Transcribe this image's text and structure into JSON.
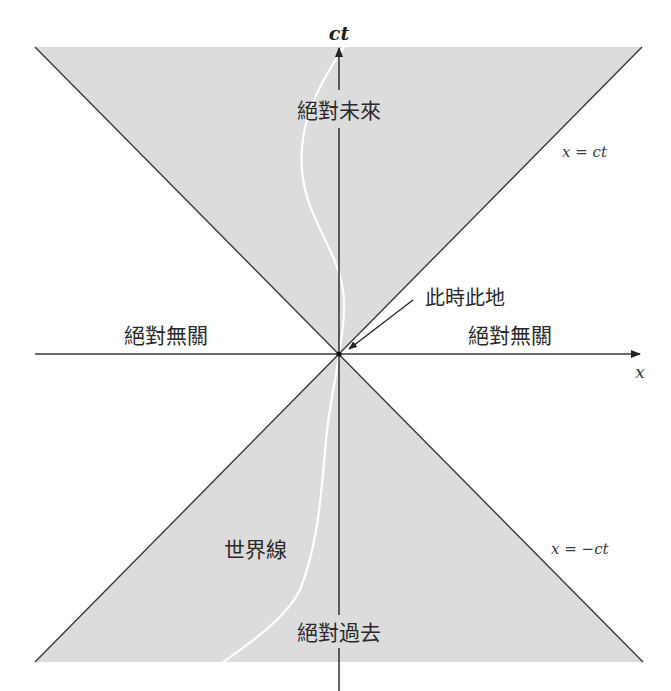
{
  "diagram": {
    "type": "spacetime-light-cone",
    "axes": {
      "vertical_label": "ct",
      "horizontal_label": "x"
    },
    "lines": {
      "upper_right_label": "x = ct",
      "lower_right_label": "x = −ct"
    },
    "regions": {
      "future": "絕對未來",
      "past": "絕對過去",
      "elsewhere_left": "絕對無關",
      "elsewhere_right": "絕對無關"
    },
    "annotations": {
      "origin": "此時此地",
      "worldline": "世界線"
    },
    "colors": {
      "cone_fill": "#dcdcdc",
      "line": "#3a3a3a",
      "worldline": "#ffffff",
      "background": "#ffffff"
    }
  }
}
